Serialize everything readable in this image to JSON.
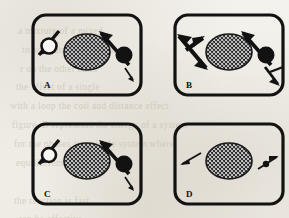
{
  "figure": {
    "background_color": "#f4f2ed",
    "ink_color": "#121212",
    "panel_count": 4,
    "bleed_through_lines": [
      {
        "text": "a mixture of a mixed",
        "x": 18,
        "y": 22
      },
      {
        "text": "to separate the mixture",
        "x": 22,
        "y": 41
      },
      {
        "text": "r on the other hand",
        "x": 20,
        "y": 60
      },
      {
        "text": "the effect of a single",
        "x": 16,
        "y": 78
      },
      {
        "text": "with a loop the coil and distance effect",
        "x": 10,
        "y": 97
      },
      {
        "text": "figure. D represents the energy of a system",
        "x": 12,
        "y": 116
      },
      {
        "text": "for the  phases in a single  system  where",
        "x": 14,
        "y": 135
      },
      {
        "text": "equilibrium of state",
        "x": 16,
        "y": 154
      },
      {
        "text": "the reaction is fast",
        "x": 14,
        "y": 192
      },
      {
        "text": "can be effective",
        "x": 18,
        "y": 210
      }
    ],
    "panels": [
      {
        "id": "A",
        "label": "A",
        "left_marker": {
          "type": "open-circle",
          "filled": false
        },
        "left_arrow": {
          "direction": "down-left",
          "weight": "bold",
          "double_headed": false
        },
        "right_marker": {
          "type": "filled-circle",
          "filled": true
        },
        "right_arrow_major": {
          "direction": "up-left",
          "weight": "bold",
          "double_headed": false
        },
        "right_arrow_minor": {
          "direction": "down-right",
          "weight": "thin",
          "double_headed": false
        },
        "center": {
          "shape": "ellipse",
          "fill": "stipple"
        }
      },
      {
        "id": "B",
        "label": "B",
        "left_marker": {
          "type": "none",
          "filled": false
        },
        "left_arrow": {
          "direction": "down-right",
          "weight": "bold",
          "double_headed": true
        },
        "right_marker": {
          "type": "filled-circle",
          "filled": true
        },
        "right_arrow_major": {
          "direction": "up-left",
          "weight": "bold",
          "double_headed": false
        },
        "right_arrow_minor": {
          "direction": "down-right",
          "weight": "bold",
          "double_headed": false
        },
        "center": {
          "shape": "ellipse",
          "fill": "stipple"
        }
      },
      {
        "id": "C",
        "label": "C",
        "left_marker": {
          "type": "open-circle",
          "filled": false
        },
        "left_arrow": {
          "direction": "down-left",
          "weight": "bold",
          "double_headed": false
        },
        "right_marker": {
          "type": "filled-circle",
          "filled": true
        },
        "right_arrow_major": {
          "direction": "up-left",
          "weight": "bold",
          "double_headed": false
        },
        "right_arrow_minor": {
          "direction": "down-right",
          "weight": "thin",
          "double_headed": false
        },
        "center": {
          "shape": "ellipse",
          "fill": "stipple"
        }
      },
      {
        "id": "D",
        "label": "D",
        "left_marker": {
          "type": "none",
          "filled": false
        },
        "left_arrow": {
          "direction": "down-left",
          "weight": "thin",
          "double_headed": false
        },
        "right_marker": {
          "type": "small-dot",
          "filled": true
        },
        "right_arrow_major": {
          "direction": "up-right",
          "weight": "thin",
          "double_headed": false
        },
        "right_arrow_minor": {
          "direction": "none",
          "weight": "none",
          "double_headed": false
        },
        "center": {
          "shape": "ellipse",
          "fill": "stipple"
        }
      }
    ]
  }
}
